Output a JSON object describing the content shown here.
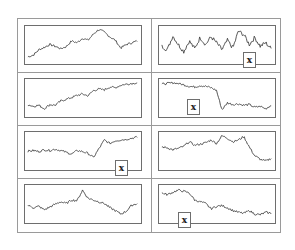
{
  "chart_data": {
    "type": "line",
    "layout": {
      "rows": 4,
      "cols": 2,
      "grid": false,
      "axes_ticks": false
    },
    "panels": [
      {
        "id": 1,
        "row": 0,
        "col": 0,
        "marker": "",
        "description": "random walk, rises to peak near 75% then declines, ends mid",
        "y": [
          0.15,
          0.2,
          0.35,
          0.42,
          0.5,
          0.45,
          0.38,
          0.44,
          0.6,
          0.55,
          0.68,
          0.62,
          0.8,
          0.93,
          0.85,
          0.72,
          0.62,
          0.4,
          0.5,
          0.55,
          0.6
        ]
      },
      {
        "id": 2,
        "row": 0,
        "col": 1,
        "marker": "x",
        "description": "high-volatility oscillating series, no clear trend",
        "y": [
          0.45,
          0.35,
          0.75,
          0.5,
          0.3,
          0.6,
          0.38,
          0.7,
          0.5,
          0.72,
          0.55,
          0.35,
          0.62,
          0.4,
          0.88,
          0.78,
          0.5,
          0.7,
          0.45,
          0.55,
          0.38
        ]
      },
      {
        "id": 3,
        "row": 1,
        "col": 0,
        "marker": "",
        "description": "gradual upward trend from low to high",
        "y": [
          0.3,
          0.25,
          0.28,
          0.18,
          0.3,
          0.28,
          0.4,
          0.45,
          0.5,
          0.56,
          0.6,
          0.55,
          0.7,
          0.74,
          0.72,
          0.8,
          0.78,
          0.85,
          0.88,
          0.9,
          0.92
        ]
      },
      {
        "id": 4,
        "row": 1,
        "col": 1,
        "marker": "x",
        "description": "high plateau with sharp drop (structural break) at ~55%, then low flat",
        "y": [
          0.88,
          0.9,
          0.92,
          0.9,
          0.86,
          0.82,
          0.8,
          0.84,
          0.82,
          0.78,
          0.7,
          0.15,
          0.35,
          0.3,
          0.32,
          0.28,
          0.3,
          0.22,
          0.25,
          0.18,
          0.28
        ]
      },
      {
        "id": 5,
        "row": 2,
        "col": 0,
        "marker": "x",
        "description": "flat noisy series, dips then sharp jump up (break) at ~65%, high after",
        "y": [
          0.48,
          0.5,
          0.47,
          0.52,
          0.5,
          0.54,
          0.5,
          0.45,
          0.4,
          0.5,
          0.47,
          0.42,
          0.3,
          0.55,
          0.8,
          0.7,
          0.78,
          0.8,
          0.82,
          0.85,
          0.88
        ]
      },
      {
        "id": 6,
        "row": 2,
        "col": 1,
        "marker": "",
        "description": "moderate fluctuation around mid-high level, sharp drop near end",
        "y": [
          0.6,
          0.58,
          0.52,
          0.56,
          0.62,
          0.75,
          0.65,
          0.68,
          0.72,
          0.8,
          0.7,
          0.92,
          0.85,
          0.75,
          0.8,
          0.9,
          0.6,
          0.35,
          0.25,
          0.2,
          0.28
        ]
      },
      {
        "id": 7,
        "row": 3,
        "col": 0,
        "marker": "",
        "description": "random walk with peak near 50%, trough near 85%",
        "y": [
          0.45,
          0.38,
          0.42,
          0.32,
          0.4,
          0.48,
          0.55,
          0.5,
          0.6,
          0.58,
          0.88,
          0.65,
          0.6,
          0.55,
          0.5,
          0.38,
          0.3,
          0.2,
          0.28,
          0.45,
          0.5
        ]
      },
      {
        "id": 8,
        "row": 3,
        "col": 1,
        "marker": "x",
        "description": "gradual downward trend from high to low",
        "y": [
          0.8,
          0.75,
          0.82,
          0.88,
          0.85,
          0.8,
          0.6,
          0.55,
          0.5,
          0.35,
          0.42,
          0.44,
          0.38,
          0.3,
          0.25,
          0.22,
          0.3,
          0.2,
          0.18,
          0.25,
          0.22
        ]
      }
    ],
    "title": "",
    "xlabel": "",
    "ylabel": "",
    "legend": "none"
  },
  "markers": {
    "x_label": "x"
  },
  "colors": {
    "line": "#3c3c3c",
    "frame": "#9a9a9a",
    "plot_border": "#6e6e6e",
    "background": "#ffffff"
  }
}
